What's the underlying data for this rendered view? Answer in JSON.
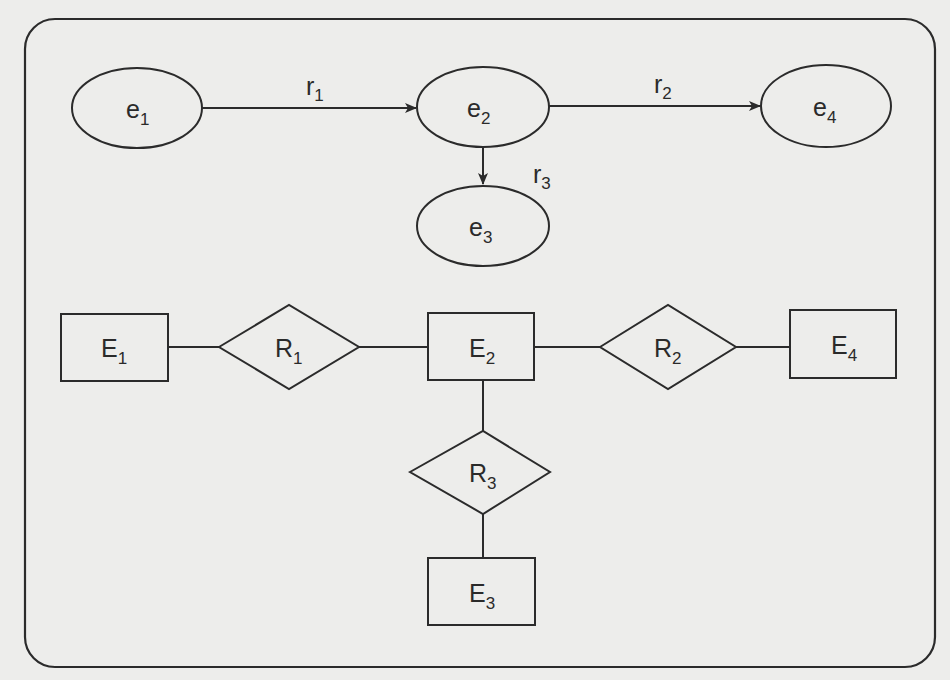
{
  "diagram": {
    "title": "",
    "stroke_color": "#2b2b2b",
    "background_color": "#ededeb",
    "top_section": {
      "nodes": [
        {
          "id": "e1",
          "base": "e",
          "sub": "1",
          "shape": "ellipse"
        },
        {
          "id": "e2",
          "base": "e",
          "sub": "2",
          "shape": "ellipse"
        },
        {
          "id": "e3",
          "base": "e",
          "sub": "3",
          "shape": "ellipse"
        },
        {
          "id": "e4",
          "base": "e",
          "sub": "4",
          "shape": "ellipse"
        }
      ],
      "edges": [
        {
          "from": "e1",
          "to": "e2",
          "base": "r",
          "sub": "1",
          "directed": true
        },
        {
          "from": "e2",
          "to": "e4",
          "base": "r",
          "sub": "2",
          "directed": true
        },
        {
          "from": "e2",
          "to": "e3",
          "base": "r",
          "sub": "3",
          "directed": true
        }
      ]
    },
    "bottom_section": {
      "entities": [
        {
          "id": "E1",
          "base": "E",
          "sub": "1",
          "shape": "rectangle"
        },
        {
          "id": "E2",
          "base": "E",
          "sub": "2",
          "shape": "rectangle"
        },
        {
          "id": "E3",
          "base": "E",
          "sub": "3",
          "shape": "rectangle"
        },
        {
          "id": "E4",
          "base": "E",
          "sub": "4",
          "shape": "rectangle"
        }
      ],
      "relationships": [
        {
          "id": "R1",
          "base": "R",
          "sub": "1",
          "shape": "diamond",
          "connects": [
            "E1",
            "E2"
          ]
        },
        {
          "id": "R2",
          "base": "R",
          "sub": "2",
          "shape": "diamond",
          "connects": [
            "E2",
            "E4"
          ]
        },
        {
          "id": "R3",
          "base": "R",
          "sub": "3",
          "shape": "diamond",
          "connects": [
            "E2",
            "E3"
          ]
        }
      ]
    }
  }
}
